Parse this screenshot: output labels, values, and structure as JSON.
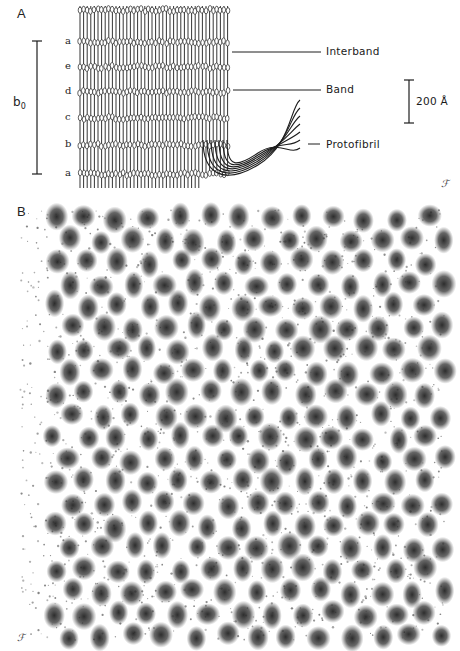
{
  "panel_a": {
    "label": "A",
    "period_label": "b",
    "period_subscript": "0",
    "row_letters": [
      "a",
      "e",
      "d",
      "c",
      "b",
      "a"
    ],
    "row_letter_y": [
      42,
      67,
      92,
      118,
      145,
      174
    ],
    "band_y": [
      10,
      42,
      67,
      92,
      118,
      145,
      174
    ],
    "callouts": {
      "interband": "Interband",
      "band": "Band",
      "protofibril": "Protofibril"
    },
    "scale_bar_label": "200 Å",
    "signature": "ℱ",
    "colors": {
      "ink": "#1e1e1e",
      "paper": "#ffffff"
    }
  },
  "panel_b": {
    "label": "B",
    "signature": "ℱ",
    "lattice": {
      "x0": 55,
      "y0": 218,
      "dx": 31,
      "dy": 44,
      "cols": 13,
      "rows": 10,
      "stagger": 15.5,
      "row_offset_y": 22,
      "blob_radius": 11
    },
    "colors": {
      "ink": "#2a2a2a",
      "paper": "#ffffff"
    }
  }
}
